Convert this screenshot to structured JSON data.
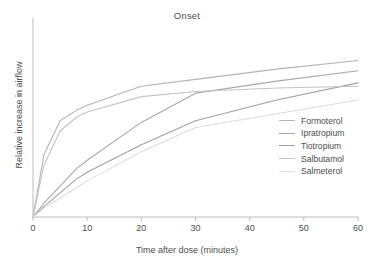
{
  "chart_data": {
    "type": "line",
    "title": "Onset",
    "xlabel": "Time after dose (minutes)",
    "ylabel": "Relative increase in airflow",
    "xlim": [
      0,
      60
    ],
    "ylim": [
      0,
      100
    ],
    "xticks": [
      "0",
      "10",
      "20",
      "30",
      "40",
      "50",
      "60"
    ],
    "yticks": [],
    "grid": false,
    "legend_position": "center right",
    "x": [
      0,
      2,
      5,
      8,
      10,
      20,
      30,
      45,
      60
    ],
    "series": [
      {
        "name": "Formoterol",
        "color": "#b4b4b4",
        "values": [
          0,
          36,
          56,
          62,
          65,
          76,
          80,
          86,
          91
        ]
      },
      {
        "name": "Ipratropium",
        "color": "#a8a8a8",
        "values": [
          0,
          8,
          18,
          28,
          33,
          55,
          72,
          79,
          85
        ]
      },
      {
        "name": "Tiotropium",
        "color": "#a0a0a0",
        "values": [
          0,
          6,
          14,
          22,
          26,
          42,
          56,
          68,
          78
        ]
      },
      {
        "name": "Salbutamol",
        "color": "#c4c4c4",
        "values": [
          0,
          30,
          50,
          58,
          61,
          70,
          73,
          75,
          76
        ]
      },
      {
        "name": "Salmeterol",
        "color": "#dcdcdc",
        "values": [
          0,
          5,
          11,
          17,
          21,
          38,
          52,
          60,
          68
        ]
      }
    ]
  },
  "axis": {
    "line_color": "#bdbdbd"
  }
}
